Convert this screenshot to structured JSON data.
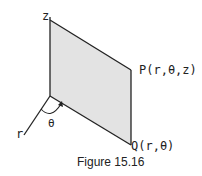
{
  "figure": {
    "caption": "Figure 15.16",
    "labels": {
      "z_axis": "z",
      "r_axis": "r",
      "theta": "θ",
      "point_p": "P(r,θ,z)",
      "point_q": "Q(r,θ)"
    },
    "colors": {
      "plane_fill": "#e3e3e3",
      "line": "#222222"
    }
  }
}
